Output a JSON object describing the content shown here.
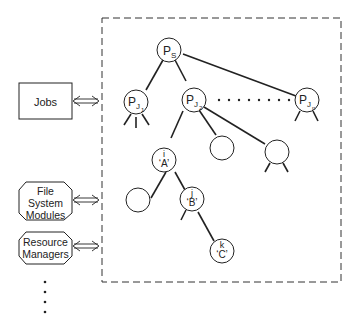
{
  "diagram": {
    "external_components": {
      "jobs": "Jobs",
      "file_system_modules": [
        "File",
        "System",
        "Modules"
      ],
      "resource_managers": [
        "Resource",
        "Managers"
      ],
      "more": "⋮"
    },
    "tree": {
      "root": {
        "main": "P",
        "sub": "S"
      },
      "job1": {
        "main": "P",
        "sub": "J",
        "subsub": "1"
      },
      "job2": {
        "main": "P",
        "sub": "J",
        "subsub": "2"
      },
      "jobn": {
        "main": "P",
        "sub": "J",
        "subsub": "n"
      },
      "node_i": {
        "id": "i",
        "name": "‘A’"
      },
      "node_j": {
        "id": "j",
        "name": "‘B’"
      },
      "node_k": {
        "id": "k",
        "name": "‘C’"
      }
    },
    "colors": {
      "ink": "#222222",
      "background": "#ffffff"
    }
  }
}
